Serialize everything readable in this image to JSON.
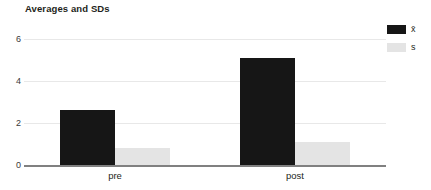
{
  "chart_data": {
    "type": "bar",
    "title": "Averages and SDs",
    "xlabel": "",
    "ylabel": "",
    "categories": [
      "pre",
      "post"
    ],
    "series": [
      {
        "name": "x̄",
        "values": [
          2.6,
          5.1
        ],
        "color": "#161616"
      },
      {
        "name": "s",
        "values": [
          0.8,
          1.1
        ],
        "color": "#e4e4e4"
      }
    ],
    "ylim": [
      0,
      6
    ],
    "yticks": [
      0,
      2,
      4,
      6
    ],
    "ytick_labels": [
      "0",
      "2",
      "4",
      "6"
    ],
    "grid": true,
    "legend_position": "top-right"
  },
  "legend": {
    "entries": [
      {
        "label": "x̄",
        "swatch": "legend-swatch-mean"
      },
      {
        "label": "s",
        "swatch": "legend-swatch-sd"
      }
    ]
  },
  "axis": {
    "y_labels": [
      "6",
      "4",
      "2",
      "0"
    ],
    "x_labels": [
      "pre",
      "post"
    ]
  },
  "colors": {
    "mean_bar": "#161616",
    "sd_bar": "#e4e4e4",
    "gridline": "#e8e8e8",
    "axis": "#808080",
    "text": "#231f20",
    "background": "#ffffff"
  }
}
